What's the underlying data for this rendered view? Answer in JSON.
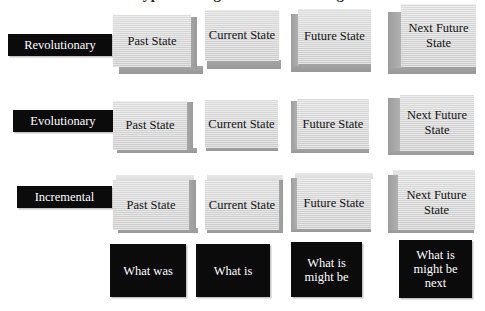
{
  "title": {
    "text_fragment": "Types of Organisational Change"
  },
  "colors": {
    "plaque_background": "#0b0b0b",
    "plaque_text": "#ffffff",
    "box_face": "#d8d8d8",
    "box_shade": "#9e9e9e",
    "page_background": "#ffffff"
  },
  "rows": [
    {
      "id": "revolutionary",
      "label": "Revolutionary"
    },
    {
      "id": "evolutionary",
      "label": "Evolutionary"
    },
    {
      "id": "incremental",
      "label": "Incremental"
    }
  ],
  "columns": [
    {
      "id": "past",
      "label": "Past State",
      "caption": "What was"
    },
    {
      "id": "current",
      "label": "Current State",
      "caption": "What is"
    },
    {
      "id": "future",
      "label": "Future State",
      "caption": "What is might be"
    },
    {
      "id": "next_future",
      "label": "Next Future State",
      "caption": "What is might be next"
    }
  ],
  "cells": {
    "revolutionary": {
      "past": "Past State",
      "current": "Current State",
      "future": "Future State",
      "next_future": "Next Future State"
    },
    "evolutionary": {
      "past": "Past State",
      "current": "Current State",
      "future": "Future State",
      "next_future": "Next Future State"
    },
    "incremental": {
      "past": "Past State",
      "current": "Current State",
      "future": "Future State",
      "next_future": "Next Future State"
    }
  },
  "captions": {
    "past": "What was",
    "current": "What is",
    "future": "What is might be",
    "next_future": "What is might be next"
  }
}
